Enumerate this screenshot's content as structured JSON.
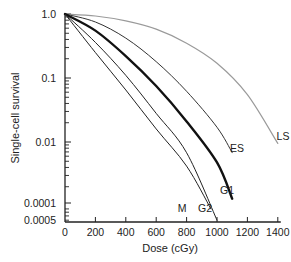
{
  "chart_data": {
    "type": "line",
    "title": "",
    "xlabel": "Dose (cGy)",
    "ylabel": "Single-cell survival",
    "xscale": "linear",
    "yscale": "log",
    "xlim": [
      0,
      1400
    ],
    "ylim": [
      0.00055,
      1.0
    ],
    "grid": false,
    "legend": "inline labels at curve ends",
    "x_ticks": [
      0,
      200,
      400,
      600,
      800,
      1000,
      1200,
      1400
    ],
    "x_tick_labels": [
      "0",
      "200",
      "400",
      "600",
      "800",
      "1000",
      "1200",
      "1400"
    ],
    "y_ticks": [
      1.0,
      0.1,
      0.01,
      0.001,
      0.0005
    ],
    "y_tick_labels": [
      "1.0",
      "0.1",
      "0.01",
      "0.0001",
      "0.0005"
    ],
    "series": [
      {
        "name": "LS",
        "color": "#9a9a9a",
        "width": 1.2,
        "x": [
          0,
          200,
          400,
          600,
          800,
          1000,
          1200,
          1400
        ],
        "values": [
          1.0,
          0.93,
          0.78,
          0.58,
          0.35,
          0.17,
          0.055,
          0.0095
        ],
        "label_pos": [
          283,
          140
        ]
      },
      {
        "name": "ES",
        "color": "#333333",
        "width": 1.0,
        "x": [
          0,
          200,
          400,
          600,
          800,
          1000,
          1100
        ],
        "values": [
          1.0,
          0.75,
          0.42,
          0.18,
          0.062,
          0.017,
          0.0068
        ],
        "label_pos": [
          237,
          152
        ]
      },
      {
        "name": "G1",
        "color": "#111111",
        "width": 2.4,
        "x": [
          0,
          200,
          400,
          600,
          800,
          1000,
          1100
        ],
        "values": [
          1.0,
          0.55,
          0.22,
          0.075,
          0.021,
          0.0048,
          0.0013
        ],
        "label_pos": [
          227,
          194
        ]
      },
      {
        "name": "G2",
        "color": "#222222",
        "width": 1.0,
        "x": [
          0,
          200,
          400,
          600,
          800,
          1000
        ],
        "values": [
          1.0,
          0.36,
          0.11,
          0.028,
          0.0068,
          0.0006
        ],
        "label_pos": [
          205,
          212
        ]
      },
      {
        "name": "M",
        "color": "#222222",
        "width": 1.0,
        "x": [
          0,
          200,
          400,
          600,
          800,
          960
        ],
        "values": [
          1.0,
          0.25,
          0.065,
          0.016,
          0.0042,
          0.0009
        ],
        "label_pos": [
          182,
          212
        ]
      }
    ]
  }
}
